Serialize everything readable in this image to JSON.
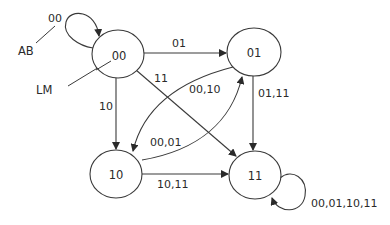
{
  "diagram": {
    "type": "state-transition-diagram",
    "corner_labels": {
      "input_label": "AB",
      "output_label": "LM",
      "sample_input": "00"
    },
    "states": [
      {
        "id": "00",
        "label": "00"
      },
      {
        "id": "01",
        "label": "01"
      },
      {
        "id": "10",
        "label": "10"
      },
      {
        "id": "11",
        "label": "11"
      }
    ],
    "transitions": [
      {
        "from": "00",
        "to": "00",
        "label": "00"
      },
      {
        "from": "00",
        "to": "01",
        "label": "01"
      },
      {
        "from": "00",
        "to": "10",
        "label": "10"
      },
      {
        "from": "00",
        "to": "11",
        "label": "11"
      },
      {
        "from": "01",
        "to": "10",
        "label": "00,10"
      },
      {
        "from": "01",
        "to": "11",
        "label": "01,11"
      },
      {
        "from": "10",
        "to": "01",
        "label": "00,01"
      },
      {
        "from": "10",
        "to": "11",
        "label": "10,11"
      },
      {
        "from": "11",
        "to": "11",
        "label": "00,01,10,11"
      }
    ]
  }
}
